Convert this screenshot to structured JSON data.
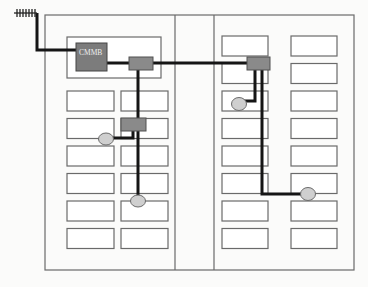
{
  "diagram": {
    "receiver": {
      "label": "CMMB",
      "icon": "receiver-box"
    },
    "antenna": {
      "icon": "antenna-icon"
    },
    "colors": {
      "cable": "#151515",
      "splitter": "#8a8a8a",
      "receiver": "#7c7c7c",
      "outlet": "#cfcfcf",
      "walls": "#6a6a6a"
    },
    "components": {
      "splitters": [
        "splitter-main-left",
        "splitter-main-right",
        "splitter-left-mid"
      ],
      "outlets": [
        "outlet-left-1",
        "outlet-left-2",
        "outlet-right-1",
        "outlet-right-2"
      ]
    },
    "wings": [
      {
        "name": "left-wing",
        "room_rows": 6,
        "room_columns": 2
      },
      {
        "name": "right-wing",
        "room_rows": 8,
        "room_columns": 2
      }
    ]
  }
}
